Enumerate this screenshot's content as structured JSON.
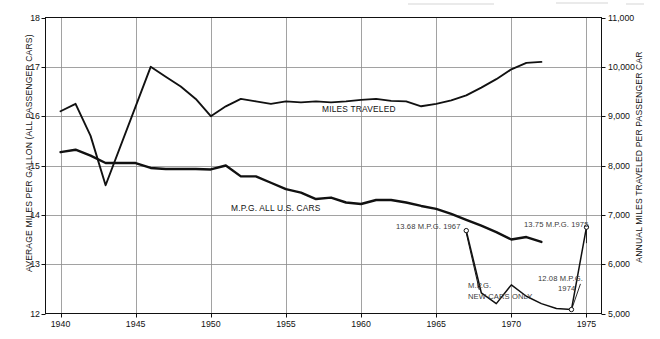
{
  "chart_data": {
    "type": "line",
    "title": "",
    "xlabel": "",
    "ylabel": "AVERAGE MILES PER GALLON (ALL PASSENGER CARS)",
    "y2label": "ANNUAL MILES TRAVELED PER PASSENGER CAR",
    "xlim": [
      1939,
      1976
    ],
    "ylim": [
      12,
      18
    ],
    "y2lim": [
      5000,
      11000
    ],
    "grid": true,
    "legend": "inline-annotations",
    "xticks": [
      1940,
      1945,
      1950,
      1955,
      1960,
      1965,
      1970,
      1975
    ],
    "xticklabels": [
      "1940",
      "1945",
      "1950",
      "1955",
      "1960",
      "1965",
      "1970",
      "1975"
    ],
    "yticks": [
      12,
      13,
      14,
      15,
      16,
      17,
      18
    ],
    "yticklabels": [
      "12",
      "13",
      "14",
      "15",
      "16",
      "17",
      "18"
    ],
    "y2ticks": [
      5000,
      6000,
      7000,
      8000,
      9000,
      10000,
      11000
    ],
    "y2ticklabels": [
      "5,000",
      "6,000",
      "7,000",
      "8,000",
      "9,000",
      "10,000",
      "11,000"
    ],
    "series": [
      {
        "name": "MILES TRAVELED",
        "axis": "right",
        "unit": "annual miles per passenger car",
        "x": [
          1940,
          1941,
          1942,
          1943,
          1946,
          1947,
          1948,
          1949,
          1950,
          1951,
          1952,
          1953,
          1954,
          1955,
          1956,
          1957,
          1958,
          1959,
          1960,
          1961,
          1962,
          1963,
          1964,
          1965,
          1966,
          1967,
          1968,
          1969,
          1970,
          1971,
          1972
        ],
        "values": [
          9100,
          9250,
          8600,
          7600,
          10000,
          9800,
          9600,
          9350,
          9000,
          9200,
          9350,
          9300,
          9250,
          9300,
          9280,
          9300,
          9280,
          9300,
          9330,
          9350,
          9310,
          9300,
          9200,
          9250,
          9320,
          9420,
          9580,
          9750,
          9950,
          10080,
          10100
        ]
      },
      {
        "name": "M.P.G. ALL U.S. CARS",
        "axis": "left",
        "unit": "miles per gallon",
        "x": [
          1940,
          1941,
          1942,
          1943,
          1944,
          1945,
          1946,
          1947,
          1948,
          1949,
          1950,
          1951,
          1952,
          1953,
          1954,
          1955,
          1956,
          1957,
          1958,
          1959,
          1960,
          1961,
          1962,
          1963,
          1964,
          1965,
          1966,
          1967,
          1968,
          1969,
          1970,
          1971,
          1972
        ],
        "values": [
          15.27,
          15.32,
          15.2,
          15.05,
          15.05,
          15.05,
          14.95,
          14.93,
          14.93,
          14.93,
          14.92,
          15.0,
          14.78,
          14.78,
          14.65,
          14.52,
          14.45,
          14.32,
          14.35,
          14.25,
          14.22,
          14.3,
          14.3,
          14.25,
          14.18,
          14.12,
          14.02,
          13.9,
          13.78,
          13.65,
          13.5,
          13.55,
          13.45
        ]
      },
      {
        "name": "M.P.G. NEW CARS ONLY",
        "axis": "left",
        "unit": "miles per gallon",
        "x": [
          1967,
          1968,
          1969,
          1970,
          1971,
          1972,
          1973,
          1974,
          1975
        ],
        "values": [
          13.68,
          12.42,
          12.2,
          12.58,
          12.35,
          12.2,
          12.1,
          12.08,
          13.75
        ]
      }
    ],
    "annotations": [
      {
        "name": "annot-1967",
        "text": "13.68 M.P.G. 1967",
        "x": 1967,
        "value": 13.68
      },
      {
        "name": "annot-1975",
        "text": "13.75 M.P.G. 1975",
        "x": 1975,
        "value": 13.75
      },
      {
        "name": "annot-1974",
        "text_line1": "12.08 M.P.G.",
        "text_line2": "1974",
        "x": 1974,
        "value": 12.08
      },
      {
        "name": "label-new-cars",
        "text_line1": "M.P.G.",
        "text_line2": "NEW CARS ONLY"
      },
      {
        "name": "label-miles-traveled",
        "text": "MILES TRAVELED"
      },
      {
        "name": "label-all-us-cars",
        "text": "M.P.G. ALL U.S. CARS"
      }
    ],
    "colors": {
      "line": "#111111",
      "grid": "#8a8a8a",
      "frame": "#111111",
      "annotation_text": "#3a3a3a",
      "background": "#ffffff"
    }
  },
  "axes": {
    "left_title": "AVERAGE MILES PER GALLON (ALL PASSENGER CARS)",
    "right_title": "ANNUAL MILES TRAVELED PER PASSENGER CAR"
  },
  "labels": {
    "miles_traveled": "MILES TRAVELED",
    "mpg_all_us_cars": "M.P.G. ALL U.S. CARS",
    "mpg_new_cars_l1": "M.P.G.",
    "mpg_new_cars_l2": "NEW CARS ONLY",
    "annot_1967": "13.68 M.P.G. 1967",
    "annot_1975": "13.75 M.P.G. 1975",
    "annot_1974_l1": "12.08 M.P.G.",
    "annot_1974_l2": "1974"
  }
}
